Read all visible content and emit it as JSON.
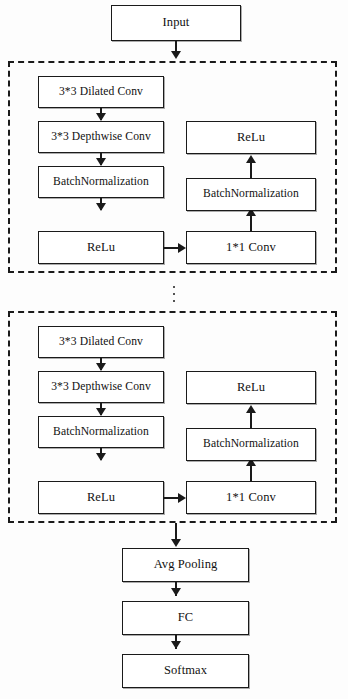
{
  "diagram": {
    "nodes": {
      "input": "Input",
      "dilated_conv": "3*3 Dilated Conv",
      "depthwise_conv": "3*3 Depthwise Conv",
      "batchnorm_left": "BatchNormalization",
      "relu_left": "ReLu",
      "relu_right": "ReLu",
      "batchnorm_right": "BatchNormalization",
      "pointwise_conv": "1*1 Conv",
      "avg_pooling": "Avg Pooling",
      "fc": "FC",
      "softmax": "Softmax"
    },
    "blocks": [
      {
        "name": "block-1",
        "nodes": {
          "dilated_conv": "3*3 Dilated Conv",
          "depthwise_conv": "3*3 Depthwise Conv",
          "batchnorm_left": "BatchNormalization",
          "relu_left": "ReLu",
          "relu_right": "ReLu",
          "batchnorm_right": "BatchNormalization",
          "pointwise_conv": "1*1 Conv"
        }
      },
      {
        "name": "block-2",
        "nodes": {
          "dilated_conv": "3*3 Dilated Conv",
          "depthwise_conv": "3*3 Depthwise Conv",
          "batchnorm_left": "BatchNormalization",
          "relu_left": "ReLu",
          "relu_right": "ReLu",
          "batchnorm_right": "BatchNormalization",
          "pointwise_conv": "1*1 Conv"
        }
      }
    ],
    "repeat_indicator": "vertical-ellipsis",
    "colors": {
      "stroke": "#1a1a1a",
      "fill": "#ffffff",
      "background": "#fdfdfd"
    }
  }
}
